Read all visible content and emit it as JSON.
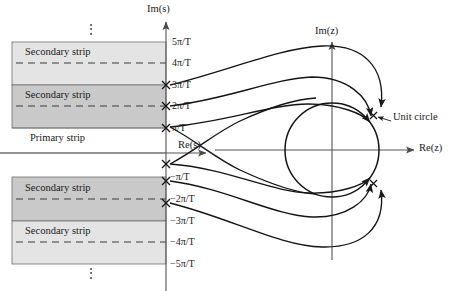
{
  "figure": {
    "title_domain": "s-plane to z-plane mapping",
    "width": 449,
    "height": 291,
    "background": "#ffffff",
    "stroke": "#1a1a1a"
  },
  "colors": {
    "ink": "#1a1a1a",
    "axis": "#555555",
    "strip_light": "#e3e3e3",
    "strip_dark": "#c9c9c9",
    "strip_border": "#6e6e6e",
    "dashed": "#4a4a4a",
    "curve": "#141414"
  },
  "s_plane": {
    "axis_labels": {
      "imaginary": "Im(s)",
      "real": "Re(s)"
    },
    "tick_labels": [
      {
        "text": "5π/T",
        "value": 5,
        "y": 42
      },
      {
        "text": "4π/T",
        "value": 4,
        "y": 63
      },
      {
        "text": "3π/T",
        "value": 3,
        "y": 85
      },
      {
        "text": "2π/T",
        "value": 2,
        "y": 106
      },
      {
        "text": "π/T",
        "value": 1,
        "y": 128
      },
      {
        "text": "−π/T",
        "value": -1,
        "y": 177
      },
      {
        "text": "−2π/T",
        "value": -2,
        "y": 199
      },
      {
        "text": "−3π/T",
        "value": -3,
        "y": 221
      },
      {
        "text": "−4π/T",
        "value": -4,
        "y": 242
      },
      {
        "text": "−5π/T",
        "value": -5,
        "y": 264
      }
    ],
    "strips": [
      {
        "name": "secondary-strip-upper-2",
        "label": "Secondary strip",
        "shade": "light",
        "from": 5,
        "to": 3,
        "label_y": 52
      },
      {
        "name": "secondary-strip-upper-1",
        "label": "Secondary strip",
        "shade": "dark",
        "from": 3,
        "to": 1,
        "label_y": 95
      },
      {
        "name": "primary-strip",
        "label": "Primary strip",
        "shade": "none",
        "from": 1,
        "to": -1,
        "label_y": 138
      },
      {
        "name": "secondary-strip-lower-1",
        "label": "Secondary strip",
        "shade": "dark",
        "from": -1,
        "to": -3,
        "label_y": 188
      },
      {
        "name": "secondary-strip-lower-2",
        "label": "Secondary strip",
        "shade": "light",
        "from": -3,
        "to": -5,
        "label_y": 231
      }
    ],
    "ellipsis_top": "⋮",
    "ellipsis_bottom": "⋮",
    "x_marks_values": [
      3,
      2,
      1,
      -1,
      -2,
      -3
    ],
    "x_mark_symbol": "×"
  },
  "z_plane": {
    "axis_labels": {
      "imaginary": "Im(z)",
      "real": "Re(z)"
    },
    "unit_circle": {
      "label": "Unit circle",
      "center_x": 332,
      "center_y": 150,
      "radius": 47
    },
    "mark_symbol": "×"
  },
  "annotations": {
    "unit_circle_callout": "Unit circle"
  }
}
